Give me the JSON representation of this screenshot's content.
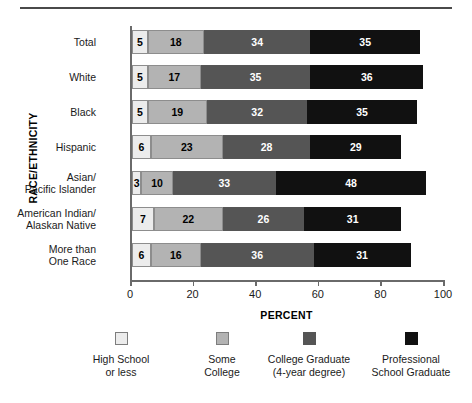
{
  "chart_data": {
    "type": "bar",
    "orientation": "horizontal",
    "stacked": true,
    "title": "",
    "xlabel": "PERCENT",
    "ylabel": "RACE/ETHNICITY",
    "xlim": [
      0,
      100
    ],
    "xticks": [
      0,
      20,
      40,
      60,
      80,
      100
    ],
    "grid": false,
    "legend_position": "bottom",
    "categories": [
      "Total",
      "White",
      "Black",
      "Hispanic",
      "Asian/\nPacific Islander",
      "American Indian/\nAlaskan Native",
      "More than\nOne Race"
    ],
    "series": [
      {
        "name": "High School\nor less",
        "color": "#ececec",
        "values": [
          5,
          5,
          5,
          6,
          3,
          7,
          6
        ]
      },
      {
        "name": "Some\nCollege",
        "color": "#b3b3b3",
        "values": [
          18,
          17,
          19,
          23,
          10,
          22,
          16
        ]
      },
      {
        "name": "College Graduate\n(4-year degree)",
        "color": "#555555",
        "values": [
          34,
          35,
          32,
          28,
          33,
          26,
          36
        ]
      },
      {
        "name": "Professional\nSchool Graduate",
        "color": "#111111",
        "values": [
          35,
          36,
          35,
          29,
          48,
          31,
          31
        ]
      }
    ]
  },
  "axis": {
    "y_title": "RACE/ETHNICITY",
    "x_title": "PERCENT",
    "x_ticks": [
      "0",
      "20",
      "40",
      "60",
      "80",
      "100"
    ]
  },
  "rows": [
    {
      "label": "Total",
      "values": [
        "5",
        "18",
        "34",
        "35"
      ]
    },
    {
      "label": "White",
      "values": [
        "5",
        "17",
        "35",
        "36"
      ]
    },
    {
      "label": "Black",
      "values": [
        "5",
        "19",
        "32",
        "35"
      ]
    },
    {
      "label": "Hispanic",
      "values": [
        "6",
        "23",
        "28",
        "29"
      ]
    },
    {
      "label": "Asian/\nPacific Islander",
      "values": [
        "3",
        "10",
        "33",
        "48"
      ]
    },
    {
      "label": "American Indian/\nAlaskan Native",
      "values": [
        "7",
        "22",
        "26",
        "31"
      ]
    },
    {
      "label": "More than\nOne Race",
      "values": [
        "6",
        "16",
        "36",
        "31"
      ]
    }
  ],
  "legend": {
    "items": [
      {
        "label": "High School\nor less",
        "color": "#ececec"
      },
      {
        "label": "Some\nCollege",
        "color": "#b3b3b3"
      },
      {
        "label": "College Graduate\n(4-year degree)",
        "color": "#555555"
      },
      {
        "label": "Professional\nSchool Graduate",
        "color": "#111111"
      }
    ]
  }
}
